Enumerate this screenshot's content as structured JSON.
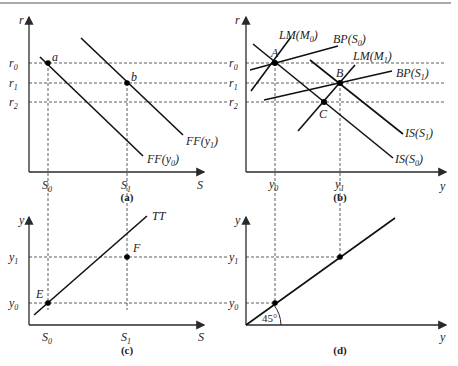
{
  "figure": {
    "panels": [
      {
        "id": "a",
        "caption": "(a)",
        "x_axis_label": "S",
        "y_axis_label": "r",
        "x_ticks": [
          {
            "name": "S",
            "sub": "0"
          },
          {
            "name": "S",
            "sub": "1"
          }
        ],
        "y_ticks": [
          {
            "name": "r",
            "sub": "0"
          },
          {
            "name": "r",
            "sub": "1"
          },
          {
            "name": "r",
            "sub": "2"
          }
        ],
        "points": [
          {
            "label": "a"
          },
          {
            "label": "b"
          }
        ],
        "curves": [
          {
            "label": "FF(y",
            "sub": "1",
            "close": ")"
          },
          {
            "label": "FF(y",
            "sub": "0",
            "close": ")"
          }
        ]
      },
      {
        "id": "b",
        "caption": "(b)",
        "x_axis_label": "y",
        "y_axis_label": "r",
        "x_ticks": [
          {
            "name": "y",
            "sub": "0"
          },
          {
            "name": "y",
            "sub": "1"
          }
        ],
        "y_ticks": [
          {
            "name": "r",
            "sub": "0"
          },
          {
            "name": "r",
            "sub": "1"
          },
          {
            "name": "r",
            "sub": "2"
          }
        ],
        "points": [
          {
            "label": "A"
          },
          {
            "label": "B"
          },
          {
            "label": "C"
          }
        ],
        "curves": [
          {
            "label": "LM(M",
            "sub": "0",
            "close": ")"
          },
          {
            "label": "BP(S",
            "sub": "0",
            "close": ")"
          },
          {
            "label": "LM(M",
            "sub": "1",
            "close": ")"
          },
          {
            "label": "BP(S",
            "sub": "1",
            "close": ")"
          },
          {
            "label": "IS(S",
            "sub": "1",
            "close": ")"
          },
          {
            "label": "IS(S",
            "sub": "0",
            "close": ")"
          }
        ]
      },
      {
        "id": "c",
        "caption": "(c)",
        "x_axis_label": "S",
        "y_axis_label": "y",
        "x_ticks": [
          {
            "name": "S",
            "sub": "0"
          },
          {
            "name": "S",
            "sub": "1"
          }
        ],
        "y_ticks": [
          {
            "name": "y",
            "sub": "1"
          },
          {
            "name": "y",
            "sub": "0"
          }
        ],
        "points": [
          {
            "label": "E"
          },
          {
            "label": "F"
          }
        ],
        "curves": [
          {
            "label": "TT"
          }
        ]
      },
      {
        "id": "d",
        "caption": "(d)",
        "x_axis_label": "y",
        "y_axis_label": "y",
        "y_ticks": [
          {
            "name": "y",
            "sub": "1"
          },
          {
            "name": "y",
            "sub": "0"
          }
        ],
        "angle_label": "45°"
      }
    ]
  }
}
